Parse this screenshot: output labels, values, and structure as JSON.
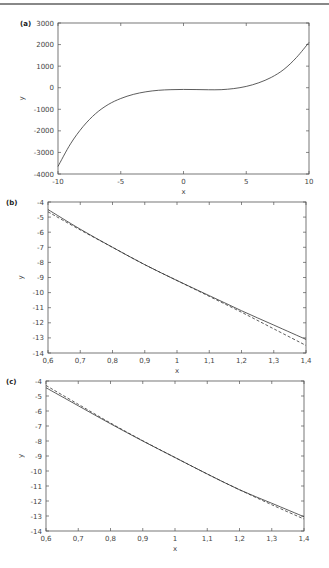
{
  "chart_data": [
    {
      "panel": "(a)",
      "type": "line",
      "xlabel": "x",
      "ylabel": "y",
      "xlim": [
        -10,
        10
      ],
      "ylim": [
        -4000,
        3000
      ],
      "xticks": [
        -10,
        -5,
        0,
        5,
        10
      ],
      "xtick_labels": [
        "-10",
        "-5",
        "0",
        "5",
        "10"
      ],
      "yticks": [
        3000,
        2000,
        1000,
        0,
        -1000,
        -2000,
        -3000,
        -4000
      ],
      "ytick_labels": [
        "3000",
        "2000",
        "1000",
        "0",
        "-1000",
        "-2000",
        "-3000",
        "-4000"
      ],
      "grid": false,
      "legend": null,
      "frame": {
        "x0": 58,
        "x1": 309,
        "y0": 23,
        "y1": 174
      },
      "series": [
        {
          "name": "solid",
          "style": "solid",
          "x": [
            -10,
            -9,
            -8,
            -7,
            -6,
            -5,
            -4,
            -3,
            -2,
            -1,
            0,
            1,
            2,
            3,
            4,
            5,
            6,
            7,
            8,
            9,
            10
          ],
          "y": [
            -3650,
            -2600,
            -1800,
            -1200,
            -780,
            -500,
            -310,
            -190,
            -120,
            -90,
            -80,
            -85,
            -95,
            -90,
            -40,
            60,
            230,
            480,
            850,
            1400,
            2100
          ]
        }
      ]
    },
    {
      "panel": "(b)",
      "type": "line",
      "xlabel": "x",
      "ylabel": "y",
      "xlim": [
        0.6,
        1.4
      ],
      "ylim": [
        -14,
        -4
      ],
      "xticks": [
        0.6,
        0.7,
        0.8,
        0.9,
        1.0,
        1.1,
        1.2,
        1.3,
        1.4
      ],
      "xtick_labels": [
        "0,6",
        "0,7",
        "0,8",
        "0,9",
        "1",
        "1,1",
        "1,2",
        "1,3",
        "1,4"
      ],
      "yticks": [
        -4,
        -5,
        -6,
        -7,
        -8,
        -9,
        -10,
        -11,
        -12,
        -13,
        -14
      ],
      "ytick_labels": [
        "-4",
        "-5",
        "-6",
        "-7",
        "-8",
        "-9",
        "-10",
        "-11",
        "-12",
        "-13",
        "-14"
      ],
      "grid": false,
      "legend": null,
      "frame": {
        "x0": 48,
        "x1": 306,
        "y0": 202,
        "y1": 353
      },
      "series": [
        {
          "name": "solid",
          "style": "solid",
          "x": [
            0.6,
            0.7,
            0.8,
            0.9,
            1.0,
            1.1,
            1.2,
            1.3,
            1.4
          ],
          "y": [
            -4.5,
            -5.8,
            -7.0,
            -8.15,
            -9.2,
            -10.2,
            -11.2,
            -12.15,
            -13.1
          ]
        },
        {
          "name": "dashed",
          "style": "dashed",
          "x": [
            0.6,
            0.7,
            0.8,
            0.9,
            1.0,
            1.1,
            1.2,
            1.3,
            1.4
          ],
          "y": [
            -4.65,
            -5.85,
            -7.0,
            -8.15,
            -9.2,
            -10.25,
            -11.3,
            -12.4,
            -13.5
          ]
        }
      ]
    },
    {
      "panel": "(c)",
      "type": "line",
      "xlabel": "x",
      "ylabel": "y",
      "xlim": [
        0.6,
        1.4
      ],
      "ylim": [
        -14,
        -4
      ],
      "xticks": [
        0.6,
        0.7,
        0.8,
        0.9,
        1.0,
        1.1,
        1.2,
        1.3,
        1.4
      ],
      "xtick_labels": [
        "0,6",
        "0,7",
        "0,8",
        "0,9",
        "1",
        "1,1",
        "1,2",
        "1,3",
        "1,4"
      ],
      "yticks": [
        -4,
        -5,
        -6,
        -7,
        -8,
        -9,
        -10,
        -11,
        -12,
        -13,
        -14
      ],
      "ytick_labels": [
        "-4",
        "-5",
        "-6",
        "-7",
        "-8",
        "-9",
        "-10",
        "-11",
        "-12",
        "-13",
        "-14"
      ],
      "grid": false,
      "legend": null,
      "frame": {
        "x0": 46,
        "x1": 304,
        "y0": 381,
        "y1": 531
      },
      "series": [
        {
          "name": "solid",
          "style": "solid",
          "x": [
            0.6,
            0.7,
            0.8,
            0.9,
            1.0,
            1.1,
            1.2,
            1.3,
            1.4
          ],
          "y": [
            -4.45,
            -5.65,
            -6.85,
            -8.0,
            -9.1,
            -10.2,
            -11.25,
            -12.15,
            -13.05
          ]
        },
        {
          "name": "dashed",
          "style": "dashed",
          "x": [
            0.6,
            0.7,
            0.8,
            0.9,
            1.0,
            1.1,
            1.2,
            1.3,
            1.4
          ],
          "y": [
            -4.3,
            -5.55,
            -6.8,
            -7.98,
            -9.1,
            -10.2,
            -11.25,
            -12.25,
            -13.2
          ]
        }
      ]
    }
  ]
}
